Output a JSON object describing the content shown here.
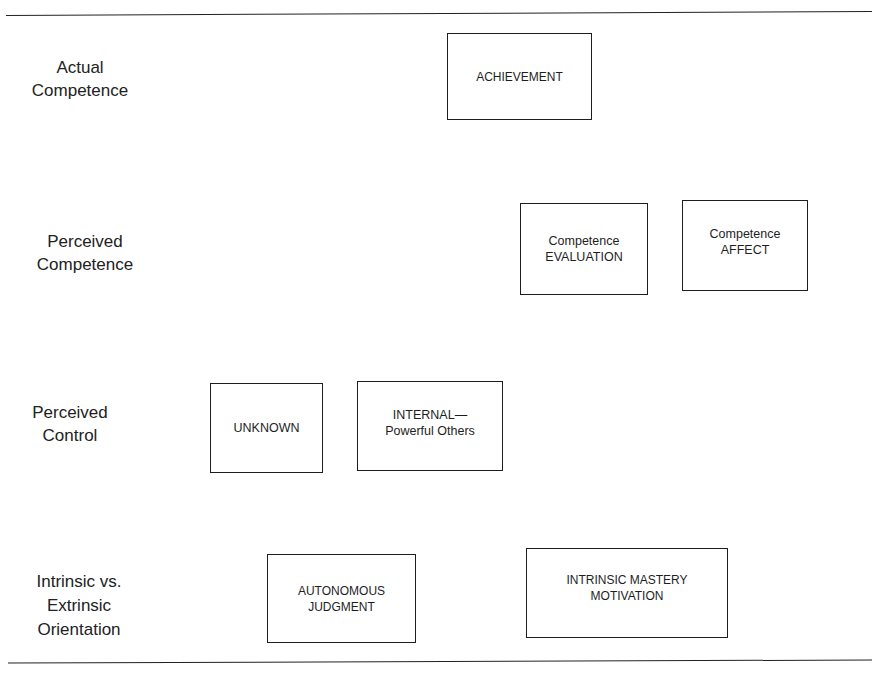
{
  "diagram": {
    "rows": [
      {
        "label": "Actual\nCompetence",
        "boxes": [
          {
            "text": "ACHIEVEMENT"
          }
        ]
      },
      {
        "label": "Perceived\nCompetence",
        "boxes": [
          {
            "text": "Competence\nEVALUATION"
          },
          {
            "text": "Competence\nAFFECT"
          }
        ]
      },
      {
        "label": "Perceived\nControl",
        "boxes": [
          {
            "text": "UNKNOWN"
          },
          {
            "text": "INTERNAL—\nPowerful Others"
          }
        ]
      },
      {
        "label": "Intrinsic vs.\nExtrinsic\nOrientation",
        "boxes": [
          {
            "text": "AUTONOMOUS\nJUDGMENT"
          },
          {
            "text": "INTRINSIC MASTERY\nMOTIVATION"
          }
        ]
      }
    ]
  }
}
